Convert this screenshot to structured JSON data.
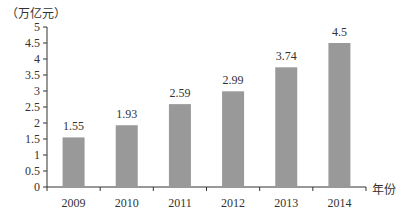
{
  "chart_data": {
    "type": "bar",
    "title": "",
    "ylabel": "（万亿元）",
    "xlabel": "年份",
    "categories": [
      "2009",
      "2010",
      "2011",
      "2012",
      "2013",
      "2014"
    ],
    "values": [
      1.55,
      1.93,
      2.59,
      2.99,
      3.74,
      4.5
    ],
    "data_labels": [
      "1.55",
      "1.93",
      "2.59",
      "2.99",
      "3.74",
      "4.5"
    ],
    "ylim": [
      0,
      5
    ],
    "yticks": [
      0,
      0.5,
      1,
      1.5,
      2,
      2.5,
      3,
      3.5,
      4,
      4.5,
      5
    ],
    "ytick_labels": [
      "0",
      "0.5",
      "1",
      "1.5",
      "2",
      "2.5",
      "3",
      "3.5",
      "4",
      "4.5",
      "5"
    ],
    "grid": false,
    "legend": null,
    "bar_color": "#999999"
  }
}
